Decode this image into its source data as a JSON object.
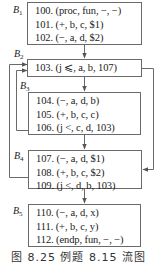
{
  "figure": {
    "caption": "图 8.25   例题 8.15 流图"
  },
  "blocks": [
    {
      "id": "B1",
      "label_main": "B",
      "label_sub": "1",
      "lines": [
        "100. (proc, fun, −, −)",
        "101. (+, b, c, $1)",
        "102. (−, a, d, $2)"
      ]
    },
    {
      "id": "B2",
      "label_main": "B",
      "label_sub": "2",
      "lines": [
        "103. (j ⩽, a, b, 107)"
      ]
    },
    {
      "id": "B3",
      "label_main": "B",
      "label_sub": "3",
      "lines": [
        "104. (−, a, d, b)",
        "105. (+, b, c, c)",
        "106. (j <, c, d, 103)"
      ]
    },
    {
      "id": "B4",
      "label_main": "B",
      "label_sub": "4",
      "lines": [
        "107. (−, a, d, $1)",
        "108. (+, b, c, $2)",
        "109. (j <, d, b, 103)"
      ]
    },
    {
      "id": "B5",
      "label_main": "B",
      "label_sub": "5",
      "lines": [
        "110. (−, a, d, x)",
        "111. (+, b, c, y)",
        "112. (endp, fun, −, −)"
      ]
    }
  ],
  "edges": [
    {
      "from": "B1",
      "to": "B2",
      "kind": "fall-through"
    },
    {
      "from": "B2",
      "to": "B3",
      "kind": "fall-through"
    },
    {
      "from": "B2",
      "to": "B4",
      "kind": "jump",
      "target": "107"
    },
    {
      "from": "B3",
      "to": "B4",
      "kind": "fall-through"
    },
    {
      "from": "B3",
      "to": "B2",
      "kind": "jump",
      "target": "103"
    },
    {
      "from": "B4",
      "to": "B5",
      "kind": "fall-through"
    },
    {
      "from": "B4",
      "to": "B2",
      "kind": "jump",
      "target": "103"
    }
  ]
}
